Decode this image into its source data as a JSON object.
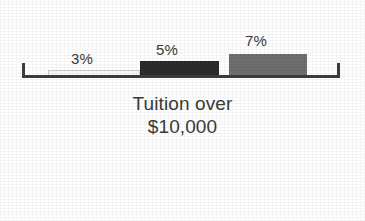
{
  "chart_data": {
    "type": "bar",
    "title": "",
    "subtitle": "",
    "xlabel": "Tuition over $10,000",
    "ylabel": "",
    "grid": false,
    "legend": "none",
    "axis": {
      "style": "bracket-baseline-with-end-ticks",
      "color": "#3c3c3c"
    },
    "categories": [
      "1",
      "2",
      "3"
    ],
    "values": [
      3,
      5,
      7
    ],
    "value_unit": "%",
    "data_labels": [
      "3%",
      "5%",
      "7%"
    ],
    "ylim": [
      0,
      9
    ],
    "series": [
      {
        "name": "Tuition over $10,000",
        "values": [
          3,
          5,
          7
        ]
      }
    ],
    "bars": [
      {
        "label": "3%",
        "value": 3,
        "fill": "#f7f7f7",
        "stroke": "#d0d0d0",
        "x": 48,
        "width": 92,
        "height": 8,
        "label_x": 71,
        "label_y": 50
      },
      {
        "label": "5%",
        "value": 5,
        "fill": "#2b2b2b",
        "stroke": "#2b2b2b",
        "x": 140,
        "width": 79,
        "height": 17,
        "label_x": 156,
        "label_y": 41
      },
      {
        "label": "7%",
        "value": 7,
        "fill": "#6e6e6e",
        "stroke": "#6e6e6e",
        "x": 229,
        "width": 78,
        "height": 24,
        "label_x": 245,
        "label_y": 32
      }
    ]
  },
  "caption": {
    "line1": "Tuition over",
    "line2": "$10,000"
  }
}
